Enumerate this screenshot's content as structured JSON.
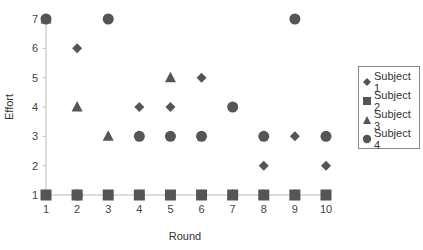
{
  "chart_data": {
    "type": "scatter",
    "title": "",
    "xlabel": "Round",
    "ylabel": "Effort",
    "x": [
      1,
      2,
      3,
      4,
      5,
      6,
      7,
      8,
      9,
      10
    ],
    "x_ticks": [
      "1",
      "2",
      "3",
      "4",
      "5",
      "6",
      "7",
      "8",
      "9",
      "10"
    ],
    "y_ticks": [
      "1",
      "2",
      "3",
      "4",
      "5",
      "6",
      "7"
    ],
    "xlim": [
      1,
      10
    ],
    "ylim": [
      1,
      7
    ],
    "grid": false,
    "legend_position": "right",
    "marker_color": "#555555",
    "series": [
      {
        "name": "Subject 1",
        "marker": "diamond",
        "values": [
          7,
          6,
          7,
          4,
          4,
          5,
          4,
          2,
          3,
          2
        ]
      },
      {
        "name": "Subject 2",
        "marker": "square",
        "values": [
          1,
          1,
          1,
          1,
          1,
          1,
          1,
          1,
          1,
          1
        ]
      },
      {
        "name": "Subject 3",
        "marker": "triangle",
        "values": [
          7,
          4,
          3,
          1,
          5,
          1,
          1,
          1,
          1,
          1
        ]
      },
      {
        "name": "Subject 4",
        "marker": "circle",
        "values": [
          7,
          1,
          7,
          3,
          3,
          3,
          4,
          3,
          7,
          3
        ]
      }
    ]
  },
  "legend": {
    "items": [
      "Subject 1",
      "Subject 2",
      "Subject 3",
      "Subject 4"
    ]
  }
}
